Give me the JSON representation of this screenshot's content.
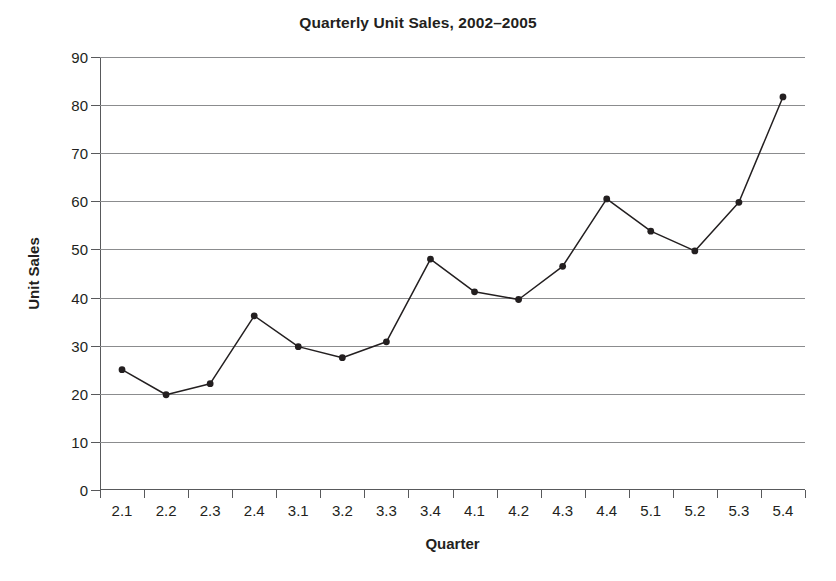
{
  "chart_data": {
    "type": "line",
    "title": "Quarterly Unit Sales, 2002–2005",
    "xlabel": "Quarter",
    "ylabel": "Unit Sales",
    "categories": [
      "2.1",
      "2.2",
      "2.3",
      "2.4",
      "3.1",
      "3.2",
      "3.3",
      "3.4",
      "4.1",
      "4.2",
      "4.3",
      "4.4",
      "5.1",
      "5.2",
      "5.3",
      "5.4"
    ],
    "values": [
      25,
      19.8,
      22.1,
      36.2,
      29.8,
      27.5,
      30.8,
      48,
      41.2,
      39.6,
      46.5,
      60.5,
      53.8,
      49.7,
      59.8,
      81.7
    ],
    "ylim": [
      0,
      90
    ],
    "ytick_values": [
      0,
      10,
      20,
      30,
      40,
      50,
      60,
      70,
      80,
      90
    ],
    "ytick_labels": [
      "0",
      "10",
      "20",
      "30",
      "40",
      "50",
      "60",
      "70",
      "80",
      "90"
    ],
    "grid": true,
    "legend": false,
    "series_color": "#231f20",
    "gridline_color": "#8b8c8e",
    "axis_color": "#58595b",
    "marker": "circle",
    "series": [
      {
        "name": "Unit Sales",
        "values": [
          25,
          19.8,
          22.1,
          36.2,
          29.8,
          27.5,
          30.8,
          48,
          41.2,
          39.6,
          46.5,
          60.5,
          53.8,
          49.7,
          59.8,
          81.7
        ]
      }
    ]
  }
}
